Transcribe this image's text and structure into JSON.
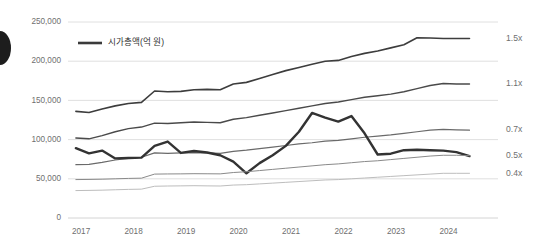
{
  "chart_data": {
    "type": "line",
    "title": "",
    "subtitle": "",
    "xlabel": "",
    "ylabel": "",
    "grid": true,
    "legend_position": "top-left",
    "xlim": [
      2016.75,
      2024.6
    ],
    "ylim": [
      0,
      250000
    ],
    "x_tick_labels": [
      "2017",
      "2018",
      "2019",
      "2020",
      "2021",
      "2022",
      "2023",
      "2024"
    ],
    "x_ticks": [
      2017,
      2018,
      2019,
      2020,
      2021,
      2022,
      2023,
      2024
    ],
    "y_tick_labels": [
      "0",
      "50,000",
      "100,000",
      "150,000",
      "200,000",
      "250,000"
    ],
    "y_ticks": [
      0,
      50000,
      100000,
      150000,
      200000,
      250000
    ],
    "legend": [
      {
        "name": "시가총액(억 원)",
        "color": "#3a3a3a"
      }
    ],
    "right_axis_annotations": [
      {
        "label": "1.5x",
        "value": 229000
      },
      {
        "label": "1.1x",
        "value": 171000
      },
      {
        "label": "0.7x",
        "value": 112000
      },
      {
        "label": "0.5x",
        "value": 80000
      },
      {
        "label": "0.4x",
        "value": 57000
      }
    ],
    "x": [
      2016.9,
      2017.15,
      2017.4,
      2017.65,
      2017.9,
      2018.15,
      2018.4,
      2018.65,
      2018.9,
      2019.15,
      2019.4,
      2019.65,
      2019.9,
      2020.15,
      2020.4,
      2020.65,
      2020.9,
      2021.15,
      2021.4,
      2021.65,
      2021.9,
      2022.15,
      2022.4,
      2022.65,
      2022.9,
      2023.15,
      2023.4,
      2023.65,
      2023.9,
      2024.15,
      2024.4
    ],
    "series": [
      {
        "name": "1.5x",
        "color": "#3d3d3d",
        "width": 1.6,
        "values": [
          136000,
          134500,
          139000,
          143000,
          146000,
          147500,
          162000,
          161000,
          161500,
          163500,
          164000,
          163500,
          171000,
          173000,
          178000,
          183000,
          188000,
          192000,
          196000,
          200000,
          201000,
          206000,
          210000,
          213000,
          217000,
          221000,
          230000,
          229500,
          229000,
          229000,
          229000
        ]
      },
      {
        "name": "1.1x",
        "color": "#4a4a4a",
        "width": 1.4,
        "values": [
          102000,
          101000,
          105000,
          110000,
          114000,
          116000,
          121000,
          120500,
          121500,
          122500,
          122000,
          121500,
          126000,
          128000,
          131000,
          134000,
          137000,
          140000,
          143000,
          146000,
          148000,
          151000,
          154000,
          156000,
          158000,
          161000,
          165000,
          169000,
          171500,
          171000,
          171000
        ]
      },
      {
        "name": "0.7x",
        "color": "#6a6a6a",
        "width": 1.2,
        "values": [
          68000,
          68500,
          71000,
          74000,
          76000,
          77500,
          83000,
          82500,
          83000,
          83500,
          83000,
          82500,
          85000,
          86500,
          88500,
          90500,
          92500,
          94500,
          96000,
          98000,
          99000,
          101000,
          103000,
          104500,
          106000,
          108000,
          110000,
          112000,
          113000,
          112500,
          112000
        ]
      },
      {
        "name": "시가총액(억 원)",
        "color": "#333333",
        "width": 2.4,
        "main": true,
        "values": [
          89000,
          82500,
          86000,
          76000,
          76500,
          77000,
          92000,
          97500,
          83000,
          85500,
          83500,
          80000,
          72000,
          57000,
          70000,
          80000,
          92000,
          110000,
          134000,
          128000,
          123000,
          130000,
          108000,
          81000,
          82000,
          86500,
          87000,
          86500,
          86000,
          84000,
          79000
        ]
      },
      {
        "name": "0.5x",
        "color": "#8a8a8a",
        "width": 1.0,
        "values": [
          49000,
          49200,
          49500,
          50000,
          50500,
          50800,
          56000,
          56200,
          56300,
          56500,
          56400,
          56300,
          58000,
          59000,
          60500,
          62000,
          63500,
          65000,
          66500,
          68000,
          69000,
          70500,
          72000,
          73000,
          74500,
          76000,
          77500,
          79000,
          80000,
          80000,
          79500
        ]
      },
      {
        "name": "0.4x",
        "color": "#bdbdbd",
        "width": 1.0,
        "values": [
          35000,
          35200,
          35500,
          36000,
          36500,
          36800,
          40500,
          40800,
          41000,
          41200,
          41000,
          40800,
          42000,
          42500,
          43500,
          44500,
          45500,
          46500,
          47500,
          48500,
          49000,
          50000,
          51000,
          52000,
          53000,
          54000,
          55000,
          56000,
          57000,
          57000,
          57000
        ]
      }
    ]
  },
  "plot": {
    "left": 68,
    "right": 480,
    "top": 22,
    "bottom": 218
  },
  "legend_swatch": {
    "x": 78,
    "y": 43,
    "w": 24,
    "label_x": 108
  }
}
